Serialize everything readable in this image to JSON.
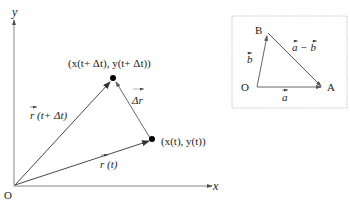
{
  "main_diagram": {
    "axis_y_label": "y",
    "axis_x_label": "x",
    "origin_label": "O",
    "point_t_label": "(x(t), y(t))",
    "point_t_dt_label": "(x(t+ Δt), y(t+ Δt))",
    "vector_r_t_label": "r (t)",
    "vector_r_t_dt_label": "r (t+ Δt)",
    "vector_delta_r_label": "Δr"
  },
  "inset_diagram": {
    "point_o_label": "O",
    "point_a_label": "A",
    "point_b_label": "B",
    "vector_a_label": "a",
    "vector_b_label": "b",
    "vector_a_minus_b_label": "a − b"
  },
  "colors": {
    "line": "#333333",
    "point": "#000000",
    "inset_border": "#bbbbbb"
  }
}
